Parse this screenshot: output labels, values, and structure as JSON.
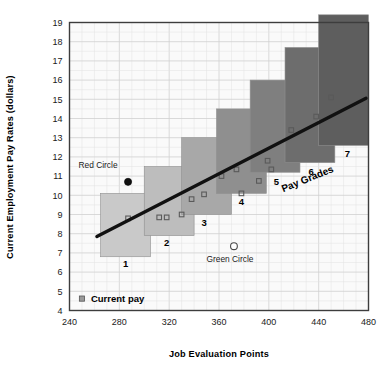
{
  "chart_data": {
    "type": "bar",
    "title": "",
    "subtitle": "",
    "xlabel": "Job Evaluation Points",
    "ylabel": "Current Employment Pay Rates (dollars)",
    "xlim": [
      240,
      480
    ],
    "ylim": [
      4,
      19
    ],
    "xticks": [
      240,
      280,
      320,
      360,
      400,
      440,
      480
    ],
    "yticks": [
      4,
      5,
      6,
      7,
      8,
      9,
      10,
      11,
      12,
      13,
      14,
      15,
      16,
      17,
      18,
      19
    ],
    "grid": true,
    "legend_position": "inside-bottom-left",
    "legend": [
      {
        "label": "Current pay",
        "marker": "square",
        "color": "#8a8a8a"
      }
    ],
    "series": [
      {
        "name": "Pay Grade Ranges",
        "type": "range-bars",
        "categories": [
          "1",
          "2",
          "3",
          "4",
          "5",
          "6",
          "7"
        ],
        "bars": [
          {
            "grade": "1",
            "x_min": 265,
            "x_max": 305,
            "y_min": 6.8,
            "y_max": 10.1,
            "color": "#c9c9c9"
          },
          {
            "grade": "2",
            "x_min": 300,
            "x_max": 340,
            "y_min": 7.9,
            "y_max": 11.5,
            "color": "#bdbdbd"
          },
          {
            "grade": "3",
            "x_min": 330,
            "x_max": 370,
            "y_min": 9.0,
            "y_max": 13.0,
            "color": "#a8a8a8"
          },
          {
            "grade": "4",
            "x_min": 358,
            "x_max": 398,
            "y_min": 10.1,
            "y_max": 14.5,
            "color": "#8f8f8f"
          },
          {
            "grade": "5",
            "x_min": 385,
            "x_max": 425,
            "y_min": 11.2,
            "y_max": 16.0,
            "color": "#7f7f7f"
          },
          {
            "grade": "6",
            "x_min": 413,
            "x_max": 453,
            "y_min": 11.7,
            "y_max": 17.7,
            "color": "#6d6d6d"
          },
          {
            "grade": "7",
            "x_min": 440,
            "x_max": 480,
            "y_min": 12.6,
            "y_max": 19.4,
            "color": "#5e5e5e"
          }
        ]
      },
      {
        "name": "Current pay",
        "type": "scatter",
        "marker": "open-square",
        "color": "#8a8a8a",
        "points": [
          {
            "x": 287,
            "y": 8.8
          },
          {
            "x": 312,
            "y": 8.85
          },
          {
            "x": 318,
            "y": 8.85
          },
          {
            "x": 330,
            "y": 9.0
          },
          {
            "x": 338,
            "y": 9.8
          },
          {
            "x": 348,
            "y": 10.05
          },
          {
            "x": 362,
            "y": 11.0
          },
          {
            "x": 374,
            "y": 11.35
          },
          {
            "x": 378,
            "y": 10.1
          },
          {
            "x": 392,
            "y": 10.75
          },
          {
            "x": 399,
            "y": 11.8
          },
          {
            "x": 402,
            "y": 11.35
          },
          {
            "x": 418,
            "y": 13.4
          },
          {
            "x": 438,
            "y": 14.1
          },
          {
            "x": 450,
            "y": 15.1
          }
        ]
      },
      {
        "name": "Market trend line",
        "type": "line",
        "color": "#111111",
        "points": [
          {
            "x": 262,
            "y": 7.85
          },
          {
            "x": 478,
            "y": 15.05
          }
        ]
      }
    ],
    "annotations": [
      {
        "label": "Red Circle",
        "x": 287,
        "y": 10.7,
        "marker": "filled-circle",
        "marker_color": "#111111",
        "label_dx": -30,
        "label_dy": -14
      },
      {
        "label": "Green Circle",
        "x": 372,
        "y": 7.35,
        "marker": "open-circle",
        "marker_color": "#ffffff",
        "label_dx": -4,
        "label_dy": 16
      },
      {
        "label": "Pay Grades",
        "x": 432,
        "y": 10.7,
        "marker": "none",
        "rotation": -22
      }
    ]
  },
  "axis": {
    "x_title": "Job Evaluation Points",
    "y_title": "Current Employment Pay Rates (dollars)",
    "x_ticks": [
      "240",
      "280",
      "320",
      "360",
      "400",
      "440",
      "480"
    ],
    "y_ticks": [
      "19",
      "18",
      "17",
      "16",
      "15",
      "14",
      "13",
      "12",
      "11",
      "10",
      "9",
      "8",
      "7",
      "6",
      "5",
      "4"
    ]
  },
  "grade_labels": [
    {
      "text": "1",
      "x": 285,
      "y": 6.25
    },
    {
      "text": "2",
      "x": 318,
      "y": 7.35
    },
    {
      "text": "3",
      "x": 348,
      "y": 8.4
    },
    {
      "text": "4",
      "x": 378,
      "y": 9.5
    },
    {
      "text": "5",
      "x": 406,
      "y": 10.55
    },
    {
      "text": "6",
      "x": 434,
      "y": 11.05
    },
    {
      "text": "7",
      "x": 463,
      "y": 12.0
    }
  ],
  "legend": {
    "marker_label": "Current pay"
  },
  "colors": {
    "plot_border": "#3d3d3d",
    "grid_minor": "#e3e3e3",
    "grid_major": "#d0d0d0",
    "plot_bg": "#fafafa",
    "trend_line": "#111111",
    "page_bg": "#ffffff"
  }
}
